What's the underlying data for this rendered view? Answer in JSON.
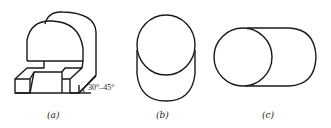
{
  "figures": [
    {
      "id": "a",
      "label": "(a)",
      "description": "cut-away arch block oblique view"
    },
    {
      "id": "b",
      "label": "(b)",
      "description": "vertical cylinder oblique view"
    },
    {
      "id": "c",
      "label": "(c)",
      "description": "horizontal cylinder oblique view"
    }
  ],
  "annotations": {
    "angle_label": "30°–45°"
  }
}
